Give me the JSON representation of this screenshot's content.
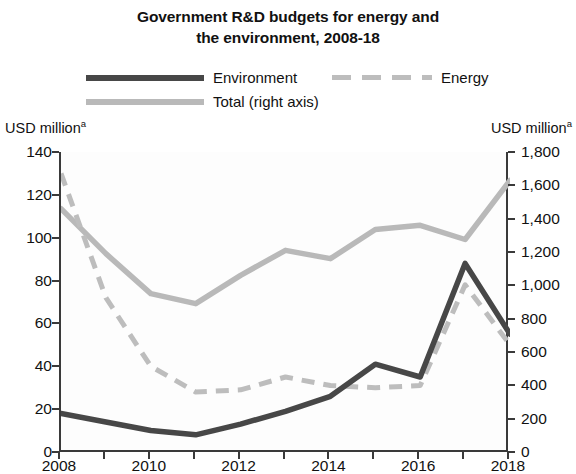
{
  "chart_data": {
    "type": "line",
    "title": "Government R&D budgets for energy and the environment, 2008-18",
    "title_line1": "Government R&D budgets for energy and",
    "title_line2": "the environment, 2008-18",
    "xlabel": "",
    "ylabel_left": "USD million",
    "ylabel_left_superscript": "a",
    "ylabel_right": "USD million",
    "ylabel_right_superscript": "a",
    "x": [
      2008,
      2009,
      2010,
      2011,
      2012,
      2013,
      2014,
      2015,
      2016,
      2017,
      2018
    ],
    "xtick_labels": [
      "2008",
      "2010",
      "2012",
      "2014",
      "2016",
      "2018"
    ],
    "xtick_values": [
      2008,
      2010,
      2012,
      2014,
      2016,
      2018
    ],
    "xlim": [
      2008,
      2018
    ],
    "ylim_left": [
      0,
      140
    ],
    "ylim_right": [
      0,
      1800
    ],
    "ytick_labels_left": [
      "140",
      "120",
      "100",
      "80",
      "60",
      "40",
      "20",
      "0"
    ],
    "ytick_values_left": [
      140,
      120,
      100,
      80,
      60,
      40,
      20,
      0
    ],
    "ytick_labels_right": [
      "1,800",
      "1,600",
      "1,400",
      "1,200",
      "1,000",
      "800",
      "600",
      "400",
      "200",
      "0"
    ],
    "ytick_values_right": [
      1800,
      1600,
      1400,
      1200,
      1000,
      800,
      600,
      400,
      200,
      0
    ],
    "grid": false,
    "legend_position": "top",
    "series": [
      {
        "name": "Environment",
        "axis": "left",
        "style": "solid",
        "color": "#474747",
        "values": [
          18,
          14,
          10,
          8,
          13,
          19,
          26,
          41,
          35,
          88,
          55
        ]
      },
      {
        "name": "Energy",
        "axis": "left",
        "style": "dashed",
        "color": "#bdbdbd",
        "values": [
          130,
          72,
          40,
          28,
          29,
          35,
          31,
          30,
          31,
          78,
          50
        ]
      },
      {
        "name": "Total (right axis)",
        "axis": "right",
        "style": "solid",
        "color": "#b9b9b9",
        "values": [
          1460,
          1190,
          950,
          890,
          1060,
          1210,
          1160,
          1335,
          1360,
          1275,
          1630
        ]
      }
    ]
  },
  "legend": {
    "items": [
      {
        "label": "Environment"
      },
      {
        "label": "Energy"
      },
      {
        "label": "Total (right axis)"
      }
    ]
  }
}
